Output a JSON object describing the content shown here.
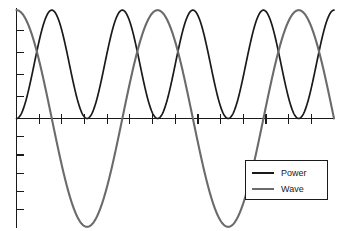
{
  "chart_data": {
    "type": "line",
    "title": "",
    "xlabel": "",
    "ylabel": "",
    "xlim": [
      0,
      2.25
    ],
    "ylim": [
      -1.02,
      1.02
    ],
    "grid": false,
    "legend_position": "bottom-right",
    "x_unit": "periods of Wave",
    "x": [
      0,
      0.0625,
      0.125,
      0.1875,
      0.25,
      0.3125,
      0.375,
      0.4375,
      0.5,
      0.5625,
      0.625,
      0.6875,
      0.75,
      0.8125,
      0.875,
      0.9375,
      1.0,
      1.0625,
      1.125,
      1.1875,
      1.25,
      1.3125,
      1.375,
      1.4375,
      1.5,
      1.5625,
      1.625,
      1.6875,
      1.75,
      1.8125,
      1.875,
      1.9375,
      2.0,
      2.0625,
      2.125,
      2.1875,
      2.25
    ],
    "series": [
      {
        "name": "Power",
        "color": "#1a1a1a",
        "formula": "sin(2*pi*x)^2",
        "values": [
          0.0,
          0.1464,
          0.5,
          0.8536,
          1.0,
          0.8536,
          0.5,
          0.1464,
          0.0,
          0.1464,
          0.5,
          0.8536,
          1.0,
          0.8536,
          0.5,
          0.1464,
          0.0,
          0.1464,
          0.5,
          0.8536,
          1.0,
          0.8536,
          0.5,
          0.1464,
          0.0,
          0.1464,
          0.5,
          0.8536,
          1.0,
          0.8536,
          0.5,
          0.1464,
          0.0,
          0.1464,
          0.5,
          0.8536,
          1.0
        ]
      },
      {
        "name": "Wave",
        "color": "#6b6b6b",
        "formula": "cos(2*pi*x)",
        "values": [
          1.0,
          0.9239,
          0.7071,
          0.3827,
          0.0,
          -0.3827,
          -0.7071,
          -0.9239,
          -1.0,
          -0.9239,
          -0.7071,
          -0.3827,
          0.0,
          0.3827,
          0.7071,
          0.9239,
          1.0,
          0.9239,
          0.7071,
          0.3827,
          0.0,
          -0.3827,
          -0.7071,
          -0.9239,
          -1.0,
          -0.9239,
          -0.7071,
          -0.3827,
          0.0,
          0.3827,
          0.7071,
          0.9239,
          1.0,
          0.9239,
          0.7071,
          0.3827,
          0.0
        ]
      }
    ],
    "annotations": [
      {
        "name": "power-peak-1",
        "x": 0.25,
        "y": 1.0
      },
      {
        "name": "power-zero-1",
        "x": 0.5,
        "y": 0.0
      },
      {
        "name": "power-peak-2",
        "x": 0.75,
        "y": 1.0
      },
      {
        "name": "power-zero-2",
        "x": 1.0,
        "y": 0.0
      },
      {
        "name": "wave-max-start",
        "x": 0.0,
        "y": 1.0
      },
      {
        "name": "wave-min",
        "x": 0.5,
        "y": -1.0
      },
      {
        "name": "wave-max-2",
        "x": 1.0,
        "y": 1.0
      }
    ]
  },
  "axes": {
    "y_axis": {
      "name": "y-axis",
      "ticks_above_count": 4,
      "ticks_below_count": 5,
      "tick_labels": []
    },
    "x_axis": {
      "name": "x-axis",
      "ticks_count": 13,
      "tick_labels": []
    }
  },
  "legend": {
    "entries": [
      {
        "label": "Power",
        "color": "#1a1a1a"
      },
      {
        "label": "Wave",
        "color": "#6b6b6b"
      }
    ]
  }
}
